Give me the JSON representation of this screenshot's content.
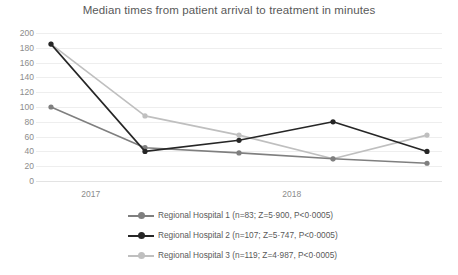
{
  "chart_data": {
    "type": "line",
    "title": "Median times from patient arrival to treatment in minutes",
    "xlabel": "",
    "ylabel": "",
    "ylim": [
      0,
      200
    ],
    "ytick_step": 20,
    "yticks": [
      200,
      180,
      160,
      140,
      120,
      100,
      80,
      60,
      40,
      20,
      0
    ],
    "grid": true,
    "legend_position": "bottom",
    "x": [
      1,
      2,
      3,
      4,
      5
    ],
    "categories": [
      "2017",
      "",
      "",
      "2018",
      ""
    ],
    "xtick_labels": [
      "2017",
      "2018"
    ],
    "series": [
      {
        "name": "Regional Hospital 1 (n=83; Z=5·900, P<0·0005)",
        "color": "#7f7f7f",
        "values": [
          100,
          45,
          38,
          30,
          24
        ]
      },
      {
        "name": "Regional Hospital 2 (n=107; Z=5·747, P<0·0005)",
        "color": "#262626",
        "values": [
          185,
          40,
          55,
          80,
          40
        ]
      },
      {
        "name": "Regional Hospital 3 (n=119; Z=4·987, P<0·0005)",
        "color": "#bfbfbf",
        "values": [
          185,
          88,
          62,
          30,
          62
        ]
      }
    ]
  },
  "axis": {
    "y_labels": [
      "200",
      "180",
      "160",
      "140",
      "120",
      "100",
      "80",
      "60",
      "40",
      "20",
      "0"
    ],
    "x_labels": [
      {
        "label": "2017",
        "pos_pct": 13.5
      },
      {
        "label": "2018",
        "pos_pct": 63.0
      }
    ]
  },
  "legend": {
    "entries": [
      {
        "label": "Regional Hospital 1 (n=83; Z=5·900, P<0·0005)",
        "color": "#7f7f7f"
      },
      {
        "label": "Regional Hospital 2 (n=107; Z=5·747, P<0·0005)",
        "color": "#262626"
      },
      {
        "label": "Regional Hospital 3 (n=119; Z=4·987, P<0·0005)",
        "color": "#bfbfbf"
      }
    ]
  },
  "colors": {
    "grid": "#eeeeee",
    "text": "#595959",
    "tick_text": "#8c8c8c",
    "background": "#ffffff"
  }
}
